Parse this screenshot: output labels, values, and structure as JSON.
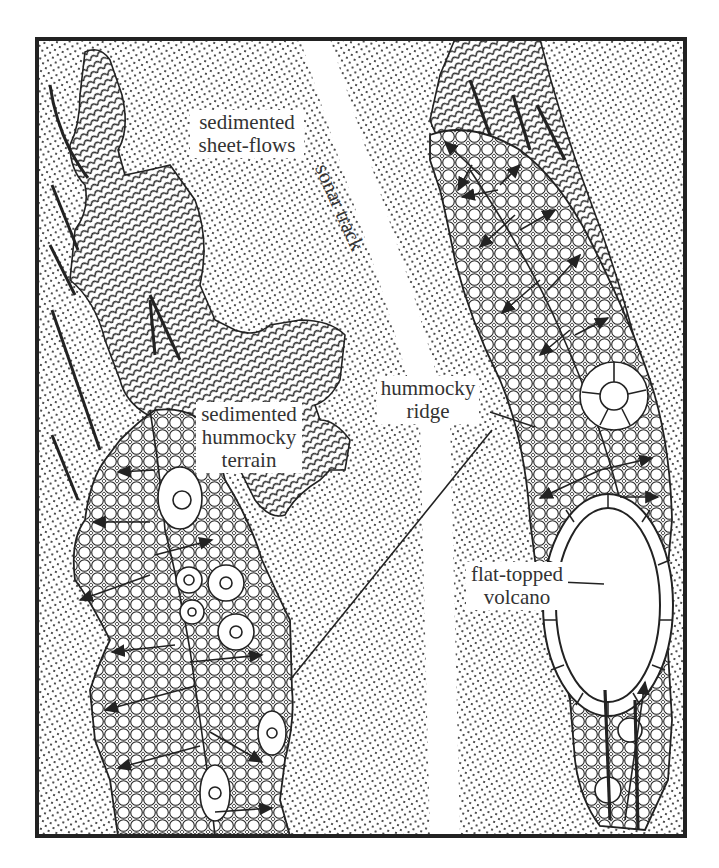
{
  "figure": {
    "type": "geologic map sketch",
    "frame": {
      "x": 37,
      "y": 39,
      "width": 648,
      "height": 797
    }
  },
  "labels": {
    "sheet_flows": {
      "lines": [
        "sedimented",
        "sheet-flows"
      ]
    },
    "sonar_track": {
      "text": "sonar track"
    },
    "sed_hummocky": {
      "lines": [
        "sedimented",
        "hummocky",
        "terrain"
      ]
    },
    "hummocky_ridge": {
      "lines": [
        "hummocky",
        "ridge"
      ]
    },
    "volcano": {
      "lines": [
        "flat-topped",
        "volcano"
      ]
    }
  },
  "legend_patterns": [
    {
      "name": "sediment",
      "pattern": "dots"
    },
    {
      "name": "sedimented-hummocky",
      "pattern": "scales"
    },
    {
      "name": "hummocky-ridge",
      "pattern": "circles"
    }
  ],
  "colors": {
    "ink": "#222222",
    "paper": "#ffffff",
    "text": "#333333"
  }
}
